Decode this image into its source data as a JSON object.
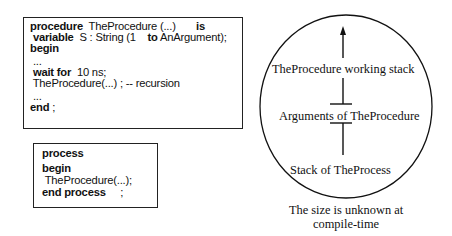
{
  "procedure_box": {
    "lines": [
      {
        "kw1": "procedure",
        "t1": "  TheProcedure (...)       ",
        "kw2": "is",
        "t2": ""
      },
      {
        "kw1": " variable",
        "t1": "  S : String (1    ",
        "kw2": "to",
        "t2": " AnArgument);"
      },
      {
        "kw1": "begin",
        "t1": "",
        "kw2": "",
        "t2": ""
      },
      {
        "kw1": "",
        "t1": " ...",
        "kw2": "",
        "t2": ""
      },
      {
        "kw1": " wait for",
        "t1": "  10 ns;",
        "kw2": "",
        "t2": ""
      },
      {
        "kw1": "",
        "t1": " TheProcedure(...) ; -- recursion",
        "kw2": "",
        "t2": ""
      },
      {
        "kw1": "",
        "t1": " ...",
        "kw2": "",
        "t2": ""
      },
      {
        "kw1": "end",
        "t1": " ;",
        "kw2": "",
        "t2": ""
      }
    ]
  },
  "process_box": {
    "lines": [
      {
        "kw1": "process",
        "t1": ""
      },
      {
        "kw1": "begin",
        "t1": ""
      },
      {
        "kw1": "",
        "t1": " TheProcedure(...);"
      },
      {
        "kw1": "end process",
        "t1": "     ;"
      }
    ]
  },
  "stack_diagram": {
    "label_top": "TheProcedure working stack",
    "label_middle": "Arguments of TheProcedure",
    "label_bottom": "Stack of TheProcess",
    "caption_line1": "The size is unknown at",
    "caption_line2": "compile-time",
    "arrow_direction": "up",
    "stroke_color": "#111111"
  }
}
